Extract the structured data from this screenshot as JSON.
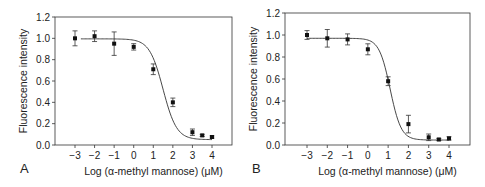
{
  "chart_data": [
    {
      "panel": "A",
      "type": "scatter",
      "fit": "sigmoidal",
      "title": "",
      "xlabel": "Log (α-methyl mannose) (μM)",
      "ylabel": "Fluorescence intensity",
      "xlim": [
        -4,
        5
      ],
      "ylim": [
        0.0,
        1.2
      ],
      "xticks": [
        "−3",
        "−2",
        "−1",
        "0",
        "1",
        "2",
        "3",
        "4"
      ],
      "xtick_values": [
        -3,
        -2,
        -1,
        0,
        1,
        2,
        3,
        4
      ],
      "yticks": [
        "0.0",
        "0.2",
        "0.4",
        "0.6",
        "0.8",
        "1.0",
        "1.2"
      ],
      "grid": false,
      "points": [
        {
          "x": -3,
          "y": 1.0,
          "err": 0.07
        },
        {
          "x": -2,
          "y": 1.02,
          "err": 0.05
        },
        {
          "x": -1,
          "y": 0.95,
          "err": 0.11
        },
        {
          "x": 0,
          "y": 0.92,
          "err": 0.03
        },
        {
          "x": 1,
          "y": 0.71,
          "err": 0.05
        },
        {
          "x": 2,
          "y": 0.4,
          "err": 0.04
        },
        {
          "x": 3,
          "y": 0.12,
          "err": 0.03
        },
        {
          "x": 3.5,
          "y": 0.09,
          "err": 0.01
        },
        {
          "x": 4,
          "y": 0.075,
          "err": 0.01
        }
      ],
      "curve": {
        "top": 0.995,
        "bottom": 0.05,
        "x50": 1.5,
        "slope": 1.25,
        "x_start": -2.7,
        "x_end": 4
      }
    },
    {
      "panel": "B",
      "type": "scatter",
      "fit": "sigmoidal",
      "title": "",
      "xlabel": "Log (α-methyl mannose) (μM)",
      "ylabel": "Fluorescence intensity",
      "xlim": [
        -3.5,
        5
      ],
      "ylim": [
        0.0,
        1.2
      ],
      "xticks": [
        "−3",
        "−2",
        "−1",
        "0",
        "1",
        "2",
        "3",
        "4"
      ],
      "xtick_values": [
        -3,
        -2,
        -1,
        0,
        1,
        2,
        3,
        4
      ],
      "yticks": [
        "0.0",
        "0.2",
        "0.4",
        "0.6",
        "0.8",
        "1.0",
        "1.2"
      ],
      "grid": false,
      "points": [
        {
          "x": -3,
          "y": 1.0,
          "err": 0.04
        },
        {
          "x": -2,
          "y": 0.97,
          "err": 0.08
        },
        {
          "x": -1,
          "y": 0.96,
          "err": 0.05
        },
        {
          "x": 0,
          "y": 0.87,
          "err": 0.05
        },
        {
          "x": 1,
          "y": 0.58,
          "err": 0.04
        },
        {
          "x": 2,
          "y": 0.19,
          "err": 0.08
        },
        {
          "x": 3,
          "y": 0.07,
          "err": 0.03
        },
        {
          "x": 3.5,
          "y": 0.05,
          "err": 0.01
        },
        {
          "x": 4,
          "y": 0.06,
          "err": 0.015
        }
      ],
      "curve": {
        "top": 0.97,
        "bottom": 0.045,
        "x50": 1.1,
        "slope": 1.6,
        "x_start": -3,
        "x_end": 4
      }
    }
  ],
  "panels": [
    {
      "label": "A"
    },
    {
      "label": "B"
    }
  ]
}
